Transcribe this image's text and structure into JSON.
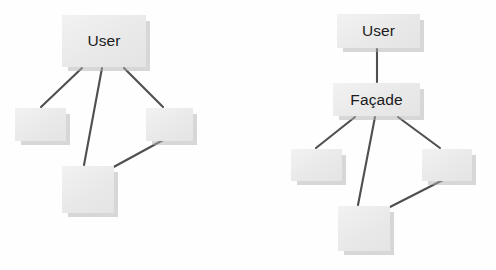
{
  "image": {
    "width": 496,
    "height": 270,
    "background_color": "#fefefe",
    "description": "Two UML-style diagrams comparing direct subsystem access versus the Facade pattern"
  },
  "style": {
    "node_fill": "#ececec",
    "node_shadow": "#afafaf",
    "edge_color": "#4f4f4f",
    "text_color": "#1b1b1b"
  },
  "diagrams": [
    {
      "id": "without-facade",
      "name": "direct-access-diagram",
      "nodes": [
        {
          "id": "left-user",
          "label": "User",
          "x": 62,
          "y": 15,
          "w": 84,
          "h": 52,
          "titled": true
        },
        {
          "id": "left-sub-1",
          "label": "",
          "x": 15,
          "y": 108,
          "w": 51,
          "h": 33,
          "titled": false
        },
        {
          "id": "left-sub-2",
          "label": "",
          "x": 146,
          "y": 108,
          "w": 47,
          "h": 33,
          "titled": false
        },
        {
          "id": "left-sub-3",
          "label": "",
          "x": 62,
          "y": 166,
          "w": 52,
          "h": 47,
          "titled": false
        }
      ],
      "edges": [
        {
          "id": "left-edge-user-sub1",
          "from": "left-user",
          "to": "left-sub-1",
          "x1": 82,
          "y1": 68,
          "x2": 41,
          "y2": 107
        },
        {
          "id": "left-edge-user-sub3",
          "from": "left-user",
          "to": "left-sub-3",
          "x1": 102,
          "y1": 68,
          "x2": 84,
          "y2": 165
        },
        {
          "id": "left-edge-user-sub2",
          "from": "left-user",
          "to": "left-sub-2",
          "x1": 124,
          "y1": 68,
          "x2": 163,
          "y2": 107
        },
        {
          "id": "left-edge-sub3-sub2",
          "from": "left-sub-3",
          "to": "left-sub-2",
          "x1": 110,
          "y1": 169,
          "x2": 165,
          "y2": 139
        }
      ]
    },
    {
      "id": "with-facade",
      "name": "facade-pattern-diagram",
      "nodes": [
        {
          "id": "right-user",
          "label": "User",
          "x": 337,
          "y": 14,
          "w": 83,
          "h": 34,
          "titled": true
        },
        {
          "id": "right-facade",
          "label": "Façade",
          "x": 333,
          "y": 83,
          "w": 87,
          "h": 33,
          "titled": true
        },
        {
          "id": "right-sub-1",
          "label": "",
          "x": 291,
          "y": 149,
          "w": 51,
          "h": 32,
          "titled": false
        },
        {
          "id": "right-sub-2",
          "label": "",
          "x": 422,
          "y": 149,
          "w": 50,
          "h": 32,
          "titled": false
        },
        {
          "id": "right-sub-3",
          "label": "",
          "x": 338,
          "y": 206,
          "w": 52,
          "h": 45,
          "titled": false
        }
      ],
      "edges": [
        {
          "id": "right-edge-user-facade",
          "from": "right-user",
          "to": "right-facade",
          "x1": 377,
          "y1": 49,
          "x2": 377,
          "y2": 82
        },
        {
          "id": "right-edge-facade-sub1",
          "from": "right-facade",
          "to": "right-sub-1",
          "x1": 355,
          "y1": 117,
          "x2": 316,
          "y2": 148
        },
        {
          "id": "right-edge-facade-sub3",
          "from": "right-facade",
          "to": "right-sub-3",
          "x1": 375,
          "y1": 117,
          "x2": 358,
          "y2": 205
        },
        {
          "id": "right-edge-facade-sub2",
          "from": "right-facade",
          "to": "right-sub-2",
          "x1": 398,
          "y1": 117,
          "x2": 440,
          "y2": 148
        },
        {
          "id": "right-edge-sub3-sub2",
          "from": "right-sub-3",
          "to": "right-sub-2",
          "x1": 386,
          "y1": 209,
          "x2": 443,
          "y2": 180
        }
      ]
    }
  ]
}
